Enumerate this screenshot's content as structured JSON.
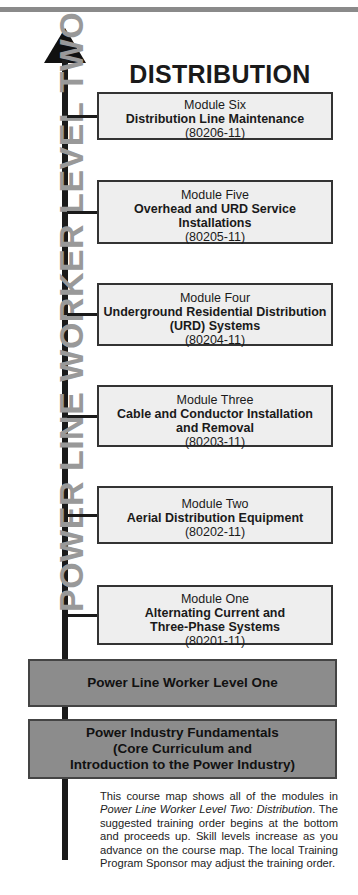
{
  "header": {
    "vertical_title": "POWER LINE WORKER LEVEL TWO",
    "section_title": "DISTRIBUTION"
  },
  "modules": [
    {
      "label": "Module Six",
      "title": "Distribution Line Maintenance",
      "code": "(80206-11)"
    },
    {
      "label": "Module Five",
      "title": "Overhead and URD Service Installations",
      "code": "(80205-11)"
    },
    {
      "label": "Module Four",
      "title": "Underground Residential Distribution (URD) Systems",
      "code": "(80204-11)"
    },
    {
      "label": "Module Three",
      "title": "Cable and Conductor Installation and Removal",
      "code": "(80203-11)"
    },
    {
      "label": "Module Two",
      "title": "Aerial Distribution Equipment",
      "code": "(80202-11)"
    },
    {
      "label": "Module One",
      "title": "Alternating Current and Three-Phase Systems",
      "code": "(80201-11)"
    }
  ],
  "prerequisites": [
    {
      "title": "Power Line Worker Level One"
    },
    {
      "title_line1": "Power Industry Fundamentals",
      "title_line2": "(Core Curriculum and",
      "title_line3": "Introduction to the Power Industry)"
    }
  ],
  "description": {
    "part1": "This course map shows all of the modules in ",
    "italic": "Power Line Worker Level Two: Distribution",
    "part2": ". The suggested training order begins at the bottom and proceeds up. Skill levels increase as you advance on the course map. The local Training Program Sponsor may adjust the training order."
  },
  "colors": {
    "module_fill": "#eeeeee",
    "level_fill": "#8c8c8c",
    "vertical_text": "#999999",
    "axis": "#1a1a1a"
  }
}
